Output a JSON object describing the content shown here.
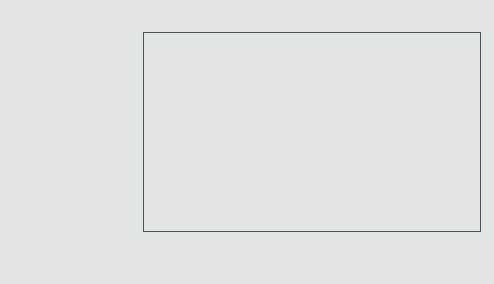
{
  "chart_data": {
    "type": "bar",
    "xlabel": "",
    "ylabel": "",
    "scale": "percentile-normal",
    "xlim": [
      1,
      99
    ],
    "grid": false,
    "legend": null,
    "value_column_header": "National PR",
    "xticks": [
      {
        "label": "1",
        "value": 1
      },
      {
        "label": "10",
        "value": 10
      },
      {
        "label": "30",
        "value": 30
      },
      {
        "label": "50",
        "value": 50
      },
      {
        "label": "70",
        "value": 70
      },
      {
        "label": "90",
        "value": 90
      },
      {
        "label": "99",
        "value": 99
      }
    ],
    "zone_dividers": [
      21,
      75
    ],
    "zones": [
      {
        "label": "Below Average",
        "center": 7
      },
      {
        "label": "Average",
        "center": 42
      },
      {
        "label": "Above Average",
        "center": 87
      }
    ],
    "categories": [
      "Total Reading",
      "Total Mathematics",
      "Language",
      "Spelling",
      "Science",
      "Social Science",
      "Listening",
      "Complete Battery"
    ],
    "values": [
      28,
      76,
      22,
      13,
      6,
      38,
      3,
      28
    ],
    "bands": [
      {
        "category": "Total Reading",
        "national_pr": 28,
        "low": 23,
        "high": 36
      },
      {
        "category": "Total Mathematics",
        "national_pr": 76,
        "low": 70,
        "high": 82
      },
      {
        "category": "Language",
        "national_pr": 22,
        "low": 14,
        "high": 30
      },
      {
        "category": "Spelling",
        "national_pr": 13,
        "low": 8,
        "high": 20
      },
      {
        "category": "Science",
        "national_pr": 6,
        "low": 3,
        "high": 12
      },
      {
        "category": "Social Science",
        "national_pr": 38,
        "low": 30,
        "high": 51
      },
      {
        "category": "Listening",
        "national_pr": 3,
        "low": 1,
        "high": 8
      },
      {
        "category": "Complete Battery",
        "national_pr": 28,
        "low": 21,
        "high": 33
      }
    ],
    "colors": {
      "background": "#e3e5e4",
      "band": "#2e3330",
      "marker": "#42474b",
      "frame": "#4c5157",
      "text": "#20242a"
    }
  }
}
